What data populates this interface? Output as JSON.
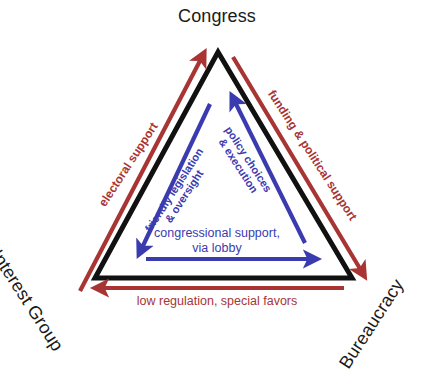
{
  "diagram": {
    "type": "iron-triangle",
    "colors": {
      "triangle": "#111111",
      "red": "#a83434",
      "blue": "#3b3bb0",
      "text": "#1a1a1a",
      "background": "#ffffff"
    },
    "nodes": [
      {
        "id": "congress",
        "label": "Congress",
        "position": "top"
      },
      {
        "id": "interest_group",
        "label": "Interest Group",
        "position": "bottom-left"
      },
      {
        "id": "bureaucracy",
        "label": "Bureaucracy",
        "position": "bottom-right"
      }
    ],
    "outer_edges": [
      {
        "id": "electoral_support",
        "label": "electoral support",
        "color": "#a83434",
        "from": "interest_group",
        "to": "congress",
        "side": "left"
      },
      {
        "id": "funding_political_support",
        "label": "funding & political support",
        "color": "#a83434",
        "from": "congress",
        "to": "bureaucracy",
        "side": "right"
      },
      {
        "id": "low_regulation",
        "label": "low regulation, special favors",
        "color": "#a83434",
        "from": "bureaucracy",
        "to": "interest_group",
        "side": "bottom"
      }
    ],
    "inner_edges": [
      {
        "id": "friendly_legislation",
        "label_line1": "friendly legislation",
        "label_line2": "& oversight",
        "color": "#3b3bb0",
        "from": "congress",
        "to": "interest_group",
        "side": "left"
      },
      {
        "id": "policy_choices",
        "label_line1": "policy choices",
        "label_line2": "& execution",
        "color": "#3b3bb0",
        "from": "bureaucracy",
        "to": "congress",
        "side": "right"
      },
      {
        "id": "congressional_support",
        "label_line1": "congressional support,",
        "label_line2": "via lobby",
        "color": "#3b3bb0",
        "from": "interest_group",
        "to": "bureaucracy",
        "side": "bottom"
      }
    ]
  }
}
